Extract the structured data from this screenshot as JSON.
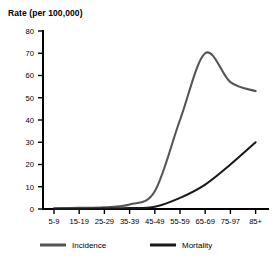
{
  "chart_data": {
    "type": "line",
    "title": "Rate (per 100,000)",
    "xlabel": "",
    "ylabel": "Rate (per 100,000)",
    "ylim": [
      0,
      80
    ],
    "ytick_step": 10,
    "yticks": [
      0,
      10,
      20,
      30,
      40,
      50,
      60,
      70,
      80
    ],
    "grid": false,
    "legend_position": "bottom",
    "categories": [
      "5-9",
      "15-19",
      "25-29",
      "35-39",
      "45-49",
      "55-59",
      "65-69",
      "75-97",
      "85+"
    ],
    "xtick_labels": [
      "5-9",
      "15-19",
      "25-29",
      "35-39",
      "45-49",
      "55-59",
      "65-69",
      "75-97",
      "85+"
    ],
    "series": [
      {
        "name": "Incidence",
        "color": "#555555",
        "values": [
          0.3,
          0.5,
          0.8,
          2.0,
          8.0,
          40.0,
          70.0,
          57.0,
          53.0
        ]
      },
      {
        "name": "Mortality",
        "color": "#1a1a1a",
        "values": [
          0.1,
          0.1,
          0.2,
          0.4,
          1.0,
          5.0,
          11.0,
          20.0,
          30.0
        ]
      }
    ]
  },
  "legend": {
    "items": [
      {
        "label": "Incidence",
        "color": "#555555"
      },
      {
        "label": "Mortality",
        "color": "#1a1a1a"
      }
    ]
  },
  "axis": {
    "title": "Rate (per 100,000)"
  }
}
